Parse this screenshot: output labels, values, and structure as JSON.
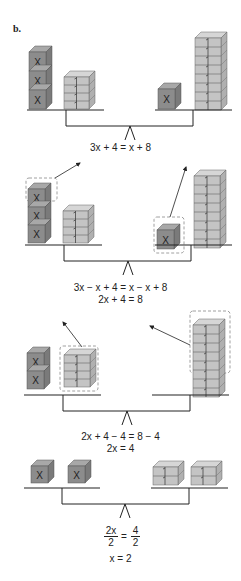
{
  "figure": {
    "label": "b.",
    "colors": {
      "x_block_front": "#8c8c8c",
      "x_block_top": "#a8a8a8",
      "x_block_side": "#7a7a7a",
      "unit_block_front": "#c4c4c4",
      "unit_block_top": "#d6d6d6",
      "unit_block_side": "#b0b0b0",
      "line": "#222222",
      "dashed": "#888888"
    },
    "block_labels": {
      "x": "X",
      "unit": "1"
    },
    "scenes": [
      {
        "name": "scene-1",
        "left": {
          "x_blocks": 3,
          "unit_blocks": 4
        },
        "right": {
          "x_blocks": 1,
          "unit_blocks": 8
        },
        "equations": [
          "3x + 4 = x + 8"
        ]
      },
      {
        "name": "scene-2",
        "left": {
          "x_blocks": 3,
          "unit_blocks": 4,
          "removed": "1 x block (dashed, arrow)"
        },
        "right": {
          "x_blocks": 1,
          "unit_blocks": 8,
          "removed": "1 x block (dashed, arrow)"
        },
        "equations": [
          "3x − x + 4 = x − x + 8",
          "2x + 4 = 8"
        ]
      },
      {
        "name": "scene-3",
        "left": {
          "x_blocks": 2,
          "unit_blocks": 4,
          "removed": "4 unit blocks (dashed, arrow)"
        },
        "right": {
          "x_blocks": 0,
          "unit_blocks": 8,
          "removed": "4 unit blocks (dashed, arrow)"
        },
        "equations": [
          "2x + 4 − 4 = 8 − 4",
          "2x = 4"
        ]
      },
      {
        "name": "scene-4",
        "left": {
          "x_blocks": 2,
          "groups": 2
        },
        "right": {
          "unit_blocks": 4,
          "groups": 2
        },
        "equations": [
          "2x/2 = 4/2",
          "x = 2"
        ],
        "fraction": {
          "left_num": "2x",
          "left_den": "2",
          "eq": "=",
          "right_num": "4",
          "right_den": "2"
        },
        "result": "x = 2"
      }
    ]
  },
  "text": {
    "eq1": "3x + 4 = x + 8",
    "eq2a": "3x − x + 4 = x − x + 8",
    "eq2b": "2x + 4 = 8",
    "eq3a": "2x + 4 − 4 = 8 − 4",
    "eq3b": "2x = 4",
    "eq4_num_left": "2x",
    "eq4_den_left": "2",
    "eq4_equals": "=",
    "eq4_num_right": "4",
    "eq4_den_right": "2",
    "eq4_result": "x = 2"
  }
}
